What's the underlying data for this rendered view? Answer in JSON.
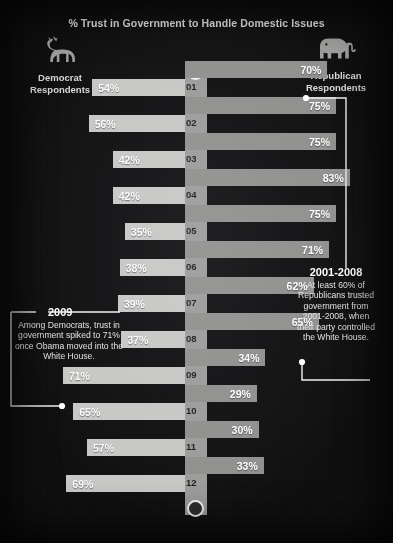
{
  "title": "% Trust in Government to Handle Domestic Issues",
  "axis": {
    "label": "Year",
    "years": [
      "01",
      "02",
      "03",
      "04",
      "05",
      "06",
      "07",
      "08",
      "09",
      "10",
      "11",
      "12"
    ]
  },
  "parties": {
    "left": {
      "name": "Democrat\nRespondents",
      "line1": "Democrat",
      "line2": "Respondents",
      "icon": "donkey-icon",
      "color": "#c6c6c4"
    },
    "right": {
      "name": "Republican\nRespondents",
      "line1": "Republican",
      "line2": "Respondents",
      "icon": "elephant-icon",
      "color": "#8e8e8c"
    }
  },
  "annotations": {
    "democrat": {
      "heading": "2009",
      "body": "Among Democrats, trust in government spiked to 71% once Obama moved into the White House."
    },
    "republican": {
      "heading": "2001-2008",
      "body": "At least 60% of Republicans trusted government from 2001-2008, when their party controlled the White House."
    }
  },
  "chart_data": {
    "type": "bar",
    "orientation": "horizontal-diverging",
    "title": "% Trust in Government to Handle Domestic Issues",
    "xlabel": "",
    "ylabel": "Year",
    "categories": [
      "01",
      "02",
      "03",
      "04",
      "05",
      "06",
      "07",
      "08",
      "09",
      "10",
      "11",
      "12"
    ],
    "xlim": [
      0,
      100
    ],
    "grid": false,
    "legend_position": "top-corners",
    "series": [
      {
        "name": "Democrat Respondents",
        "side": "left",
        "color": "#c6c6c4",
        "values": [
          54,
          56,
          42,
          42,
          35,
          38,
          39,
          37,
          71,
          65,
          57,
          69
        ],
        "labels": [
          "54%",
          "56%",
          "42%",
          "42%",
          "35%",
          "38%",
          "39%",
          "37%",
          "71%",
          "65%",
          "57%",
          "69%"
        ]
      },
      {
        "name": "Republican Respondents",
        "side": "right",
        "color": "#8e8e8c",
        "values": [
          70,
          75,
          75,
          83,
          75,
          71,
          62,
          65,
          34,
          29,
          30,
          33
        ],
        "labels": [
          "70%",
          "75%",
          "75%",
          "83%",
          "75%",
          "71%",
          "62%",
          "65%",
          "34%",
          "29%",
          "30%",
          "33%"
        ]
      }
    ],
    "annotations": [
      {
        "target_year": "09",
        "side": "left",
        "heading": "2009",
        "text": "Among Democrats, trust in government spiked to 71% once Obama moved into the White House."
      },
      {
        "target_year": "01",
        "side": "right",
        "heading": "2001-2008",
        "text": "At least 60% of Republicans trusted government from 2001-2008, when their party controlled the White House."
      }
    ]
  }
}
